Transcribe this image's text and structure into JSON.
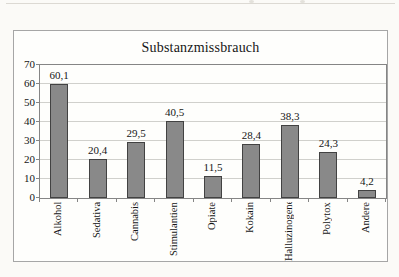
{
  "chart_data": {
    "type": "bar",
    "title": "Substanzmissbrauch",
    "categories": [
      "Alkohol",
      "Sedativa",
      "Cannabis",
      "Stimulantien",
      "Opiate",
      "Kokain",
      "Halluzinogene",
      "Polytox",
      "Andere"
    ],
    "values": [
      60.1,
      20.4,
      29.5,
      40.5,
      11.5,
      28.4,
      38.3,
      24.3,
      4.2
    ],
    "value_labels": [
      "60,1",
      "20,4",
      "29,5",
      "40,5",
      "11,5",
      "28,4",
      "38,3",
      "24,3",
      "4,2"
    ],
    "xlabel": "",
    "ylabel": "",
    "ylim": [
      0,
      70
    ],
    "ytick_step": 10,
    "yticks": [
      0,
      10,
      20,
      30,
      40,
      50,
      60,
      70
    ],
    "grid": true,
    "legend": "none",
    "x_label_rotation_deg": 90,
    "bar_color": "#898989",
    "bar_border_color": "#424242",
    "gridline_color": "#d0d0cc",
    "axis_color": "#858585"
  }
}
